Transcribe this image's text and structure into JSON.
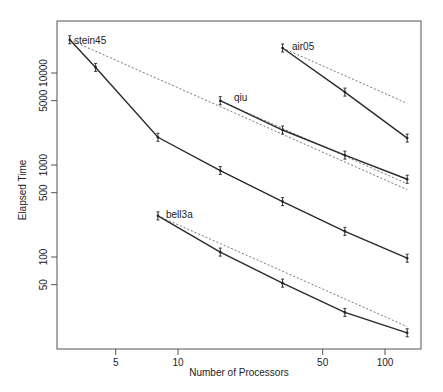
{
  "chart_data": {
    "type": "line",
    "title": "",
    "xlabel": "Number of Processors",
    "ylabel": "Elapsed Time",
    "xscale": "log",
    "yscale": "log",
    "xticks": [
      5,
      10,
      50,
      100
    ],
    "xtick_labels": [
      "5",
      "10",
      "50",
      "100"
    ],
    "yticks": [
      50,
      100,
      500,
      1000,
      5000,
      10000
    ],
    "ytick_labels": [
      "50",
      "100",
      "500",
      "1000",
      "5000",
      "10000"
    ],
    "xlim": [
      2.6,
      160
    ],
    "ylim": [
      11,
      36000
    ],
    "grid": false,
    "legend": "none (direct labels)",
    "series": [
      {
        "name": "stein45",
        "x": [
          3,
          4,
          8,
          16,
          32,
          64,
          128
        ],
        "values": [
          23000,
          11500,
          2000,
          870,
          400,
          190,
          97
        ],
        "ideal_speedup_dashed": true
      },
      {
        "name": "air05",
        "x": [
          32,
          64,
          128
        ],
        "values": [
          18700,
          6200,
          1960
        ],
        "ideal_speedup_dashed": true,
        "ideal_values": [
          18700,
          9350,
          4675
        ]
      },
      {
        "name": "qiu",
        "x": [
          16,
          32,
          64,
          128
        ],
        "values": [
          5000,
          2400,
          1280,
          700
        ],
        "ideal_speedup_dashed": true,
        "ideal_values": [
          5000,
          2500,
          1250,
          625
        ]
      },
      {
        "name": "bell3a",
        "x": [
          8,
          16,
          32,
          64,
          128
        ],
        "values": [
          280,
          113,
          52,
          25,
          15
        ],
        "ideal_speedup_dashed": true
      }
    ]
  },
  "labels": {
    "xlabel": "Number of Processors",
    "ylabel": "Elapsed Time",
    "series": [
      "stein45",
      "air05",
      "qiu",
      "bell3a"
    ]
  },
  "colors": {
    "line": "#2a2a2a",
    "dashed": "#666666",
    "axis": "#555555"
  }
}
